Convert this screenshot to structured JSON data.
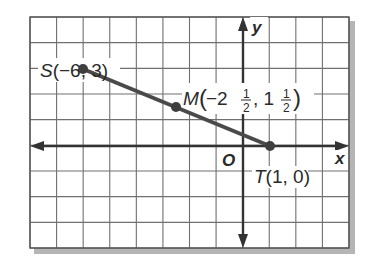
{
  "diagram": {
    "type": "coordinate-plane",
    "grid": {
      "x_min": -8,
      "x_max": 4,
      "y_min": -4,
      "y_max": 5,
      "step": 1
    },
    "axes": {
      "x_label": "x",
      "y_label": "y",
      "origin_label": "O"
    },
    "segment": {
      "from": "S",
      "to": "T",
      "color": "#4a4a4a"
    },
    "points": [
      {
        "name": "S",
        "x": -6,
        "y": 3,
        "label": "S(−6, 3)"
      },
      {
        "name": "M",
        "x": -2.5,
        "y": 1.5,
        "label": "M(−2½, 1½)"
      },
      {
        "name": "T",
        "x": 1,
        "y": 0,
        "label": "T(1, 0)"
      }
    ],
    "label_parts": {
      "S": {
        "letter": "S",
        "coords": "(−6, 3)"
      },
      "M": {
        "letter": "M",
        "open": "(−2",
        "frac_num": "1",
        "frac_den": "2",
        "comma": ", 1",
        "frac2_num": "1",
        "frac2_den": "2",
        "close": ")"
      },
      "T": {
        "letter": "T",
        "coords": "(1, 0)"
      }
    },
    "colors": {
      "grid": "#6a6a6a",
      "axis": "#333333",
      "segment": "#4a4a4a",
      "shadow": "#9a9a9a"
    }
  }
}
